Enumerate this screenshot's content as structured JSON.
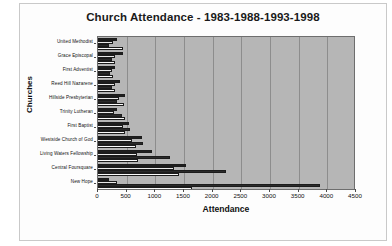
{
  "chart_data": {
    "type": "bar",
    "orientation": "horizontal",
    "title": "Church Attendance - 1983-1988-1993-1998",
    "xlabel": "Attendance",
    "ylabel": "Churches",
    "xlim": [
      0,
      4500
    ],
    "xticks": [
      0,
      500,
      1000,
      1500,
      2000,
      2500,
      3000,
      3500,
      4000,
      4500
    ],
    "xtick_labels": [
      "0",
      "500",
      "1000",
      "1500",
      "2000",
      "2500",
      "3000",
      "3500",
      "4000",
      "4500"
    ],
    "grid": true,
    "grid_axis": "x",
    "legend": "none",
    "plot_background": "#b6b6b6",
    "categories": [
      "United Methodist",
      "Grace Episcopal",
      "First Adventist",
      "Reed Hill Nazarene",
      "Hillside Presbyterian",
      "Trinity Lutheran",
      "First Baptist",
      "Westside Church of God",
      "Living Waters Fellowship",
      "Central Foursquare",
      "New Hope"
    ],
    "series": [
      {
        "name": "1983",
        "color": "#1f1f1f",
        "values": [
          330,
          430,
          300,
          380,
          470,
          330,
          540,
          760,
          950,
          1540,
          200
        ]
      },
      {
        "name": "1988",
        "color": "#e9e9e9",
        "values": [
          270,
          300,
          240,
          300,
          360,
          280,
          440,
          600,
          680,
          1330,
          340
        ]
      },
      {
        "name": "1993",
        "color": "#2a2a2a",
        "values": [
          190,
          250,
          210,
          250,
          330,
          420,
          560,
          790,
          1250,
          2240,
          3880
        ]
      },
      {
        "name": "1998",
        "color": "#fbfbfb",
        "values": [
          430,
          300,
          270,
          300,
          460,
          470,
          470,
          660,
          690,
          1420,
          1640
        ]
      }
    ]
  }
}
